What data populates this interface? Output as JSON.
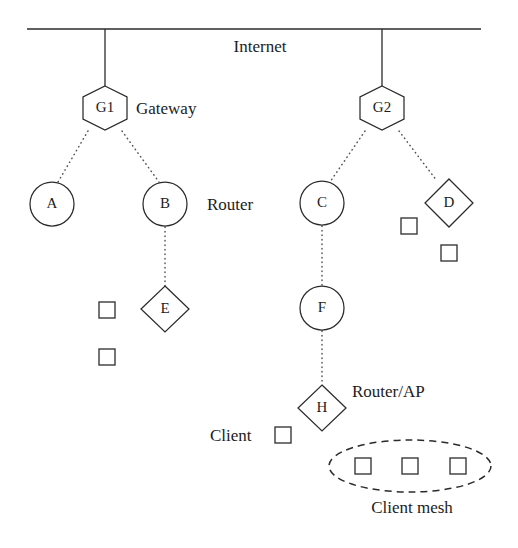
{
  "diagram": {
    "canvas": {
      "width": 518,
      "height": 548,
      "background": "#ffffff"
    },
    "stroke_color": "#2b2b2b",
    "dotted_color": "#555555"
  },
  "tier_labels": {
    "internet": "Internet",
    "gateway": "Gateway",
    "router": "Router",
    "router_ap": "Router/AP",
    "client": "Client",
    "client_mesh": "Client mesh"
  },
  "nodes": {
    "gateways": [
      {
        "id": "G1",
        "label": "G1",
        "shape": "hexagon",
        "cx": 105,
        "cy": 108
      },
      {
        "id": "G2",
        "label": "G2",
        "shape": "hexagon",
        "cx": 382,
        "cy": 108
      }
    ],
    "routers": [
      {
        "id": "A",
        "label": "A",
        "shape": "circle",
        "cx": 52,
        "cy": 204
      },
      {
        "id": "B",
        "label": "B",
        "shape": "circle",
        "cx": 165,
        "cy": 204
      },
      {
        "id": "C",
        "label": "C",
        "shape": "circle",
        "cx": 322,
        "cy": 203
      },
      {
        "id": "D",
        "label": "D",
        "shape": "diamond",
        "cx": 449,
        "cy": 203
      },
      {
        "id": "E",
        "label": "E",
        "shape": "diamond",
        "cx": 165,
        "cy": 309
      },
      {
        "id": "F",
        "label": "F",
        "shape": "circle",
        "cx": 322,
        "cy": 308
      },
      {
        "id": "H",
        "label": "H",
        "shape": "diamond",
        "cx": 322,
        "cy": 408
      }
    ],
    "clients": [
      {
        "id": "c1",
        "cx": 107,
        "cy": 310,
        "in_mesh": false
      },
      {
        "id": "c2",
        "cx": 107,
        "cy": 357,
        "in_mesh": false
      },
      {
        "id": "c3",
        "cx": 409,
        "cy": 226,
        "in_mesh": false
      },
      {
        "id": "c4",
        "cx": 449,
        "cy": 253,
        "in_mesh": false
      },
      {
        "id": "c5",
        "cx": 283,
        "cy": 435,
        "in_mesh": false
      },
      {
        "id": "m1",
        "cx": 363,
        "cy": 466,
        "in_mesh": true
      },
      {
        "id": "m2",
        "cx": 410,
        "cy": 466,
        "in_mesh": true
      },
      {
        "id": "m3",
        "cx": 458,
        "cy": 466,
        "in_mesh": true
      }
    ]
  },
  "links": {
    "solid": [
      {
        "from": "Internet bus",
        "to": "G1",
        "x1": 105,
        "y1": 29,
        "x2": 105,
        "y2": 86
      },
      {
        "from": "Internet bus",
        "to": "G2",
        "x1": 382,
        "y1": 29,
        "x2": 382,
        "y2": 86
      }
    ],
    "dotted": [
      {
        "from": "G1",
        "to": "A",
        "x1": 88,
        "y1": 130,
        "x2": 58,
        "y2": 181
      },
      {
        "from": "G1",
        "to": "B",
        "x1": 122,
        "y1": 130,
        "x2": 159,
        "y2": 181
      },
      {
        "from": "G2",
        "to": "C",
        "x1": 365,
        "y1": 130,
        "x2": 330,
        "y2": 181
      },
      {
        "from": "G2",
        "to": "D",
        "x1": 399,
        "y1": 130,
        "x2": 437,
        "y2": 180
      },
      {
        "from": "B",
        "to": "E",
        "x1": 165,
        "y1": 226,
        "x2": 165,
        "y2": 286
      },
      {
        "from": "C",
        "to": "F",
        "x1": 322,
        "y1": 225,
        "x2": 322,
        "y2": 286
      },
      {
        "from": "F",
        "to": "H",
        "x1": 322,
        "y1": 330,
        "x2": 322,
        "y2": 385
      }
    ]
  },
  "mesh_region": {
    "label": "Client mesh",
    "cx": 410,
    "cy": 466,
    "rx": 81,
    "ry": 26,
    "style": "dashed-ellipse"
  },
  "legend_positions": {
    "internet": {
      "x": 260,
      "y": 52
    },
    "gateway": {
      "x": 136,
      "y": 114
    },
    "router": {
      "x": 207,
      "y": 210
    },
    "router_ap": {
      "x": 352,
      "y": 397
    },
    "client": {
      "x": 210,
      "y": 441
    },
    "client_mesh": {
      "x": 412,
      "y": 513
    }
  },
  "bus": {
    "x1": 27,
    "x2": 481,
    "y": 29
  }
}
